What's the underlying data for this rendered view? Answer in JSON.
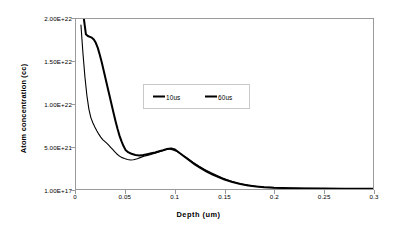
{
  "chart_data": {
    "type": "line",
    "title": "",
    "xlabel": "Depth (um)",
    "ylabel": "Atom concentration (cc)",
    "xlim": [
      0,
      0.3
    ],
    "ylim": [
      1e+17,
      2e+22
    ],
    "grid": false,
    "legend_position": "inside-upper-center",
    "x_ticks": [
      0,
      0.05,
      0.1,
      0.15,
      0.2,
      0.25,
      0.3
    ],
    "x_tick_labels": [
      "0",
      "0.05",
      "0.1",
      "0.15",
      "0.2",
      "0.25",
      "0.3"
    ],
    "y_ticks": [
      2e+22,
      1.5e+22,
      1e+22,
      5e+21,
      1e+17
    ],
    "y_tick_labels": [
      "2.00E+22",
      "1.50E+22",
      "1.00E+22",
      "5.00E+21",
      "1.00E+17"
    ],
    "series": [
      {
        "name": "10us",
        "color": "#000000",
        "line_width": 2.0,
        "x": [
          0.008,
          0.01,
          0.012,
          0.014,
          0.016,
          0.018,
          0.02,
          0.022,
          0.024,
          0.026,
          0.028,
          0.03,
          0.032,
          0.034,
          0.036,
          0.038,
          0.04,
          0.042,
          0.044,
          0.046,
          0.048,
          0.05,
          0.053,
          0.056,
          0.06,
          0.064,
          0.068,
          0.072,
          0.076,
          0.08,
          0.084,
          0.088,
          0.092,
          0.096,
          0.1,
          0.104,
          0.108,
          0.112,
          0.116,
          0.12,
          0.126,
          0.132,
          0.138,
          0.144,
          0.15,
          0.158,
          0.166,
          0.174,
          0.182,
          0.19,
          0.2,
          0.215,
          0.23,
          0.25,
          0.27,
          0.29,
          0.3
        ],
        "y": [
          2e+22,
          1.82e+22,
          1.8e+22,
          1.79e+22,
          1.78e+22,
          1.76e+22,
          1.72e+22,
          1.66e+22,
          1.58e+22,
          1.49e+22,
          1.39e+22,
          1.29e+22,
          1.19e+22,
          1.09e+22,
          9.9e+21,
          8.9e+21,
          7.95e+21,
          7.05e+21,
          6.25e+21,
          5.6e+21,
          5.05e+21,
          4.6e+21,
          4.3e+21,
          4.15e+21,
          4e+21,
          3.95e+21,
          4e+21,
          4.1e+21,
          4.2e+21,
          4.3e+21,
          4.45e+21,
          4.55e+21,
          4.7e+21,
          4.78e+21,
          4.65e+21,
          4.3e+21,
          3.95e+21,
          3.6e+21,
          3.25e+21,
          2.9e+21,
          2.45e+21,
          2.05e+21,
          1.7e+21,
          1.4e+21,
          1.12e+21,
          8.2e+20,
          5.9e+20,
          4.2e+20,
          3e+20,
          2.2e+20,
          1.5e+20,
          1e+20,
          7e+19,
          5e+19,
          4e+19,
          3.5e+19,
          3e+19
        ]
      },
      {
        "name": "60us",
        "color": "#000000",
        "line_width": 1.1,
        "x": [
          0.005,
          0.007,
          0.009,
          0.011,
          0.013,
          0.015,
          0.017,
          0.019,
          0.021,
          0.023,
          0.025,
          0.027,
          0.029,
          0.031,
          0.033,
          0.035,
          0.037,
          0.039,
          0.041,
          0.043,
          0.046,
          0.049,
          0.052,
          0.055,
          0.058,
          0.062,
          0.066,
          0.07,
          0.074,
          0.078,
          0.082,
          0.086,
          0.09,
          0.094,
          0.098,
          0.102,
          0.106,
          0.11,
          0.114,
          0.118,
          0.124,
          0.13,
          0.136,
          0.142,
          0.148,
          0.156,
          0.164,
          0.172,
          0.18,
          0.19,
          0.2,
          0.215,
          0.23,
          0.25,
          0.27,
          0.29,
          0.3
        ],
        "y": [
          1.93e+22,
          1.6e+22,
          1.32e+22,
          1.1e+22,
          9.4e+21,
          8.4e+21,
          7.8e+21,
          7.3e+21,
          6.85e+21,
          6.45e+21,
          6.1e+21,
          5.8e+21,
          5.6e+21,
          5.4e+21,
          5.15e+21,
          4.9e+21,
          4.65e+21,
          4.4e+21,
          4.15e+21,
          3.95e+21,
          3.72e+21,
          3.58e+21,
          3.48e+21,
          3.42e+21,
          3.45e+21,
          3.55e+21,
          3.75e+21,
          3.9e+21,
          4e+21,
          4.15e+21,
          4.3e+21,
          4.45e+21,
          4.62e+21,
          4.72e+21,
          4.6e+21,
          4.4e+21,
          4.12e+21,
          3.8e+21,
          3.48e+21,
          3.15e+21,
          2.7e+21,
          2.3e+21,
          1.95e+21,
          1.62e+21,
          1.3e+21,
          9.5e+20,
          6.8e+20,
          4.8e+20,
          3.4e+20,
          2.3e+20,
          1.6e+20,
          1.05e+20,
          7.2e+19,
          5.2e+19,
          4e+19,
          3.5e+19,
          3e+19
        ]
      }
    ]
  },
  "legend": {
    "entries": [
      {
        "label": "10us"
      },
      {
        "label": "60us"
      }
    ]
  }
}
